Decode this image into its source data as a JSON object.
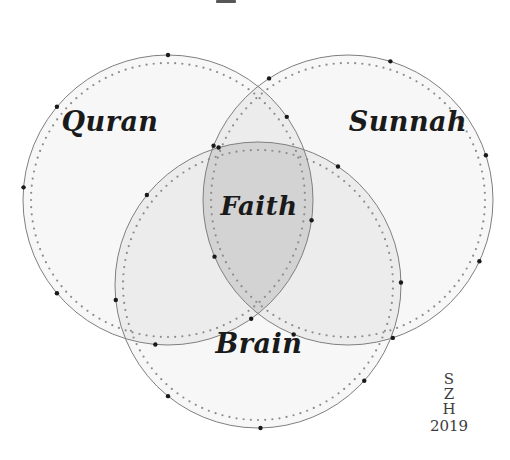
{
  "figure": {
    "type": "venn-diagram",
    "set_count": 3,
    "background_color": "#ffffff"
  },
  "sets": [
    {
      "id": "quran",
      "label": "Quran",
      "label_x": 110,
      "label_y": 123,
      "center_x": 168,
      "center_y": 200,
      "radius": 145,
      "fill_color": "#f7f7f7",
      "stroke_color": "#7f7f7f"
    },
    {
      "id": "sunnah",
      "label": "Sunnah",
      "label_x": 408,
      "label_y": 123,
      "center_x": 348,
      "center_y": 200,
      "radius": 145,
      "fill_color": "#f7f7f7",
      "stroke_color": "#7f7f7f"
    },
    {
      "id": "brain",
      "label": "Brain",
      "label_x": 259,
      "label_y": 345,
      "center_x": 258,
      "center_y": 285,
      "radius": 143,
      "fill_color": "#f7f7f7",
      "stroke_color": "#7f7f7f"
    }
  ],
  "intersection": {
    "id": "faith",
    "label": "Faith",
    "label_x": 259,
    "label_y": 208,
    "fill_color": "#d3d3d3",
    "description": "Quran ∩ Sunnah ∩ Brain"
  },
  "pairwise_fill_color": "#ececec",
  "dotted_inner": {
    "stroke_color": "#8c8c8c",
    "dot_radius": 1.1,
    "inset": 8
  },
  "marker_dots": {
    "color": "#1a1a1a",
    "radius": 2.2
  },
  "signature": {
    "initials": [
      "S",
      "Z",
      "H"
    ],
    "year": "2019",
    "x": 449,
    "y_start": 384,
    "line_height": 15,
    "color": "#3c3c3c"
  },
  "chart_data": {
    "type": "venn",
    "title": "",
    "sets": [
      "Quran",
      "Sunnah",
      "Brain"
    ],
    "intersection_label": "Faith",
    "labels": [
      "Quran",
      "Sunnah",
      "Brain",
      "Faith"
    ],
    "legend": "none",
    "annotations": [
      "S",
      "Z",
      "H",
      "2019"
    ]
  }
}
